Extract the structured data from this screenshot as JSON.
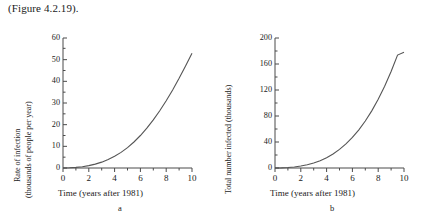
{
  "caption": "(Figure 4.2.19).",
  "charts": [
    {
      "letter": "a",
      "ylabel_line1": "Rate of infection",
      "ylabel_line2": "(thousands of people per year)",
      "xlabel": "Time (years after 1981)",
      "yticks": [
        "0",
        "10",
        "20",
        "30",
        "40",
        "50",
        "60"
      ],
      "xticks": [
        "0",
        "2",
        "4",
        "6",
        "8",
        "10"
      ]
    },
    {
      "letter": "b",
      "ylabel_line1": "Total number infected (thousands)",
      "ylabel_line2": "",
      "xlabel": "Time (years after 1981)",
      "yticks": [
        "0",
        "40",
        "80",
        "120",
        "160",
        "200"
      ],
      "xticks": [
        "0",
        "2",
        "4",
        "6",
        "8",
        "10"
      ]
    }
  ],
  "chart_data": [
    {
      "type": "line",
      "title": "",
      "panel": "a",
      "xlabel": "Time (years after 1981)",
      "ylabel": "Rate of infection (thousands of people per year)",
      "xlim": [
        0,
        10
      ],
      "ylim": [
        0,
        60
      ],
      "xticks": [
        0,
        2,
        4,
        6,
        8,
        10
      ],
      "yticks": [
        0,
        10,
        20,
        30,
        40,
        50,
        60
      ],
      "grid": false,
      "legend": "none",
      "series": [
        {
          "name": "Rate of infection",
          "x": [
            0,
            0.5,
            1,
            1.5,
            2,
            2.5,
            3,
            3.5,
            4,
            4.5,
            5,
            5.5,
            6,
            6.5,
            7,
            7.5,
            8,
            8.5,
            9,
            9.5,
            10
          ],
          "y": [
            0.0,
            0.1,
            0.3,
            0.6,
            1.1,
            1.8,
            2.7,
            3.9,
            5.4,
            7.2,
            9.4,
            12.0,
            15.0,
            18.4,
            22.2,
            26.4,
            31.0,
            36.0,
            41.4,
            47.1,
            53.0
          ]
        }
      ]
    },
    {
      "type": "line",
      "title": "",
      "panel": "b",
      "xlabel": "Time (years after 1981)",
      "ylabel": "Total number infected (thousands)",
      "xlim": [
        0,
        10
      ],
      "ylim": [
        0,
        200
      ],
      "xticks": [
        0,
        2,
        4,
        6,
        8,
        10
      ],
      "yticks": [
        0,
        40,
        80,
        120,
        160,
        200
      ],
      "grid": false,
      "legend": "none",
      "series": [
        {
          "name": "Total number infected",
          "x": [
            0,
            0.5,
            1,
            1.5,
            2,
            2.5,
            3,
            3.5,
            4,
            4.5,
            5,
            5.5,
            6,
            6.5,
            7,
            7.5,
            8,
            8.5,
            9,
            9.5,
            10
          ],
          "y": [
            0.0,
            0.2,
            0.7,
            1.6,
            3.0,
            5.0,
            7.7,
            11.3,
            15.9,
            21.6,
            28.6,
            37.0,
            47.0,
            58.7,
            72.3,
            87.9,
            105.7,
            125.8,
            148.4,
            173.7,
            178.0
          ]
        }
      ]
    }
  ],
  "colors": {
    "axis": "#4a4a4a",
    "curve": "#555555",
    "text": "#1a1a1a"
  }
}
